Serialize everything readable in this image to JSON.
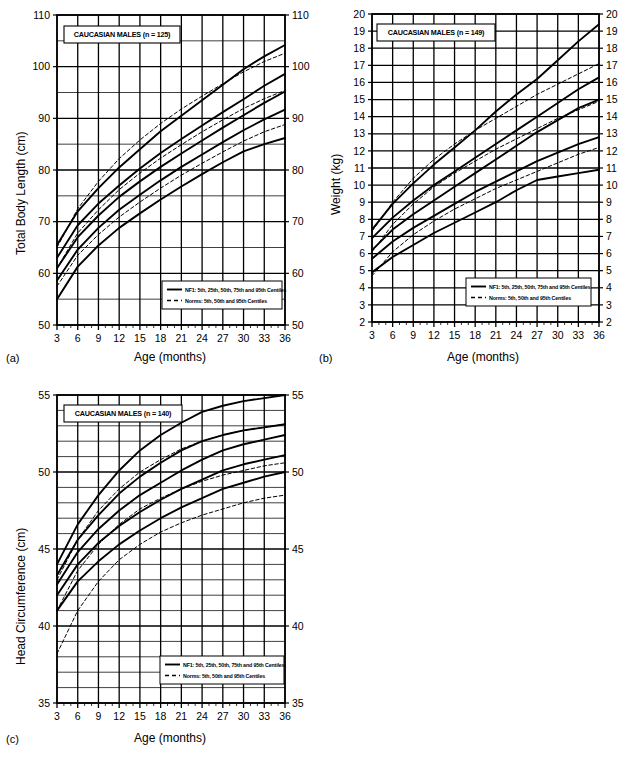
{
  "figure": {
    "panels": [
      {
        "id": "a",
        "panel_label": "(a)",
        "title": "CAUCASIAN MALES (n = 125)",
        "ylabel": "Total Body Length (cm)",
        "xlabel": "Age (months)",
        "legend": {
          "solid": "NF1: 5th, 25th, 50th, 75th and 95th Centiles",
          "dashed": "Norms: 5th, 50th and 95th Centiles"
        }
      },
      {
        "id": "b",
        "panel_label": "(b)",
        "title": "CAUCASIAN MALES (n = 149)",
        "ylabel": "Weight (kg)",
        "xlabel": "Age (months)",
        "legend": {
          "solid": "NF1: 5th, 25th, 50th, 75th and 95th Centiles",
          "dashed": "Norms: 5th, 50th and 95th Centiles"
        }
      },
      {
        "id": "c",
        "panel_label": "(c)",
        "title": "CAUCASIAN MALES (n = 140)",
        "ylabel": "Head Circumference (cm)",
        "xlabel": "Age (months)",
        "legend": {
          "solid": "NF1: 5th, 25th, 50th, 75th and 95th Centiles",
          "dashed": "Norms: 5th, 50th and 95th Centiles"
        }
      }
    ]
  },
  "chart_data": [
    {
      "type": "line",
      "panel": "a",
      "title": "CAUCASIAN MALES (n = 125)",
      "xlabel": "Age (months)",
      "ylabel": "Total Body Length (cm)",
      "xlim": [
        3,
        36
      ],
      "ylim": [
        50,
        110
      ],
      "xticks": [
        3,
        6,
        9,
        12,
        15,
        18,
        21,
        24,
        27,
        30,
        33,
        36
      ],
      "yticks": [
        50,
        60,
        70,
        80,
        90,
        100,
        110
      ],
      "ygrid_minor_step": 5,
      "xgrid_step": 3,
      "grid": true,
      "legend_position": "bottom-right",
      "x": [
        3,
        6,
        9,
        12,
        15,
        18,
        21,
        24,
        27,
        30,
        33,
        36
      ],
      "series": [
        {
          "name": "NF1 95th Centile",
          "style": "solid",
          "values": [
            65.5,
            72.0,
            76.5,
            80.5,
            84.0,
            87.5,
            90.5,
            93.5,
            96.5,
            99.5,
            102.0,
            104.2
          ]
        },
        {
          "name": "NF1 75th Centile",
          "style": "solid",
          "values": [
            63.0,
            69.3,
            73.5,
            77.0,
            80.3,
            83.3,
            86.0,
            88.6,
            91.2,
            93.7,
            96.3,
            98.6
          ]
        },
        {
          "name": "NF1 50th Centile",
          "style": "solid",
          "values": [
            61.0,
            67.0,
            71.2,
            74.8,
            77.8,
            80.6,
            83.2,
            85.7,
            88.2,
            90.6,
            93.0,
            95.2
          ]
        },
        {
          "name": "NF1 25th Centile",
          "style": "solid",
          "values": [
            58.6,
            64.6,
            68.8,
            72.3,
            75.2,
            78.0,
            80.6,
            83.0,
            85.4,
            87.7,
            89.8,
            91.7
          ]
        },
        {
          "name": "NF1 5th Centile",
          "style": "solid",
          "values": [
            55.0,
            61.3,
            65.4,
            68.8,
            71.6,
            74.3,
            76.8,
            79.2,
            81.5,
            83.6,
            85.0,
            86.2
          ]
        },
        {
          "name": "Norms 95th Centile",
          "style": "dashed",
          "values": [
            65.0,
            72.5,
            77.8,
            82.2,
            85.8,
            89.0,
            91.8,
            94.3,
            96.7,
            99.0,
            101.0,
            102.6
          ]
        },
        {
          "name": "Norms 50th Centile",
          "style": "dashed",
          "values": [
            61.0,
            67.8,
            72.3,
            76.2,
            79.4,
            82.3,
            84.9,
            87.4,
            89.7,
            91.9,
            93.8,
            95.4
          ]
        },
        {
          "name": "Norms 5th Centile",
          "style": "dashed",
          "values": [
            57.5,
            63.5,
            67.5,
            70.9,
            73.8,
            76.5,
            79.0,
            81.3,
            83.5,
            85.6,
            87.4,
            88.8
          ]
        }
      ]
    },
    {
      "type": "line",
      "panel": "b",
      "title": "CAUCASIAN MALES (n = 149)",
      "xlabel": "Age (months)",
      "ylabel": "Weight (kg)",
      "xlim": [
        3,
        36
      ],
      "ylim": [
        2,
        20
      ],
      "xticks": [
        3,
        6,
        9,
        12,
        15,
        18,
        21,
        24,
        27,
        30,
        33,
        36
      ],
      "yticks": [
        2,
        3,
        4,
        5,
        6,
        7,
        8,
        9,
        10,
        11,
        12,
        13,
        14,
        15,
        16,
        17,
        18,
        19,
        20
      ],
      "ygrid_minor_step": 1,
      "xgrid_step": 3,
      "grid": true,
      "legend_position": "bottom-right",
      "x": [
        3,
        6,
        9,
        12,
        15,
        18,
        21,
        24,
        27,
        30,
        33,
        36
      ],
      "series": [
        {
          "name": "NF1 95th Centile",
          "style": "solid",
          "values": [
            7.4,
            8.9,
            10.1,
            11.2,
            12.2,
            13.2,
            14.3,
            15.3,
            16.2,
            17.3,
            18.4,
            19.4
          ]
        },
        {
          "name": "NF1 75th Centile",
          "style": "solid",
          "values": [
            6.9,
            8.1,
            9.1,
            10.0,
            10.8,
            11.6,
            12.4,
            13.2,
            14.0,
            14.8,
            15.6,
            16.3
          ]
        },
        {
          "name": "NF1 50th Centile",
          "style": "solid",
          "values": [
            6.2,
            7.4,
            8.3,
            9.1,
            9.9,
            10.7,
            11.5,
            12.3,
            13.1,
            13.8,
            14.5,
            15.0
          ]
        },
        {
          "name": "NF1 25th Centile",
          "style": "solid",
          "values": [
            5.7,
            6.7,
            7.5,
            8.2,
            8.9,
            9.6,
            10.2,
            10.8,
            11.4,
            11.9,
            12.4,
            12.8
          ]
        },
        {
          "name": "NF1 5th Centile",
          "style": "solid",
          "values": [
            4.9,
            5.8,
            6.5,
            7.2,
            7.8,
            8.4,
            9.0,
            9.7,
            10.3,
            10.5,
            10.7,
            10.9
          ]
        },
        {
          "name": "Norms 95th Centile",
          "style": "dashed",
          "values": [
            7.3,
            9.0,
            10.4,
            11.5,
            12.4,
            13.2,
            13.9,
            14.6,
            15.3,
            15.9,
            16.5,
            17.1
          ]
        },
        {
          "name": "Norms 50th Centile",
          "style": "dashed",
          "values": [
            6.1,
            7.7,
            8.9,
            9.9,
            10.7,
            11.4,
            12.1,
            12.7,
            13.3,
            13.9,
            14.4,
            14.9
          ]
        },
        {
          "name": "Norms 5th Centile",
          "style": "dashed",
          "values": [
            4.7,
            6.1,
            7.1,
            7.9,
            8.6,
            9.2,
            9.8,
            10.3,
            10.8,
            11.3,
            11.8,
            12.2
          ]
        }
      ]
    },
    {
      "type": "line",
      "panel": "c",
      "title": "CAUCASIAN MALES (n = 140)",
      "xlabel": "Age (months)",
      "ylabel": "Head Circumference (cm)",
      "xlim": [
        3,
        36
      ],
      "ylim": [
        35,
        55
      ],
      "xticks": [
        3,
        6,
        9,
        12,
        15,
        18,
        21,
        24,
        27,
        30,
        33,
        36
      ],
      "yticks": [
        35,
        40,
        45,
        50,
        55
      ],
      "ygrid_minor_step": 1,
      "xgrid_step": 3,
      "grid": true,
      "legend_position": "bottom-right",
      "x": [
        3,
        6,
        9,
        12,
        15,
        18,
        21,
        24,
        27,
        30,
        33,
        36
      ],
      "series": [
        {
          "name": "NF1 95th Centile",
          "style": "solid",
          "values": [
            44.0,
            46.6,
            48.5,
            50.1,
            51.4,
            52.4,
            53.2,
            53.9,
            54.3,
            54.6,
            54.8,
            55.0
          ]
        },
        {
          "name": "NF1 75th Centile",
          "style": "solid",
          "values": [
            43.3,
            45.6,
            47.2,
            48.6,
            49.7,
            50.6,
            51.4,
            52.0,
            52.4,
            52.7,
            52.9,
            53.1
          ]
        },
        {
          "name": "NF1 50th Centile",
          "style": "solid",
          "values": [
            42.7,
            44.8,
            46.3,
            47.5,
            48.5,
            49.3,
            50.1,
            50.8,
            51.4,
            51.8,
            52.1,
            52.4
          ]
        },
        {
          "name": "NF1 25th Centile",
          "style": "solid",
          "values": [
            42.0,
            44.0,
            45.4,
            46.5,
            47.4,
            48.2,
            48.9,
            49.5,
            50.1,
            50.5,
            50.8,
            51.1
          ]
        },
        {
          "name": "NF1 5th Centile",
          "style": "solid",
          "values": [
            41.0,
            42.9,
            44.2,
            45.3,
            46.2,
            47.0,
            47.7,
            48.3,
            48.9,
            49.3,
            49.7,
            50.0
          ]
        },
        {
          "name": "Norms 95th Centile",
          "style": "dashed",
          "values": [
            43.0,
            45.6,
            47.5,
            48.9,
            50.0,
            50.8,
            51.5,
            52.0,
            52.4,
            52.7,
            52.9,
            53.1
          ]
        },
        {
          "name": "Norms 50th Centile",
          "style": "dashed",
          "values": [
            41.0,
            43.6,
            45.3,
            46.6,
            47.6,
            48.3,
            48.9,
            49.4,
            49.8,
            50.1,
            50.4,
            50.6
          ]
        },
        {
          "name": "Norms 5th Centile",
          "style": "dashed",
          "values": [
            38.2,
            41.0,
            42.9,
            44.3,
            45.3,
            46.1,
            46.7,
            47.2,
            47.6,
            48.0,
            48.3,
            48.5
          ]
        }
      ]
    }
  ]
}
